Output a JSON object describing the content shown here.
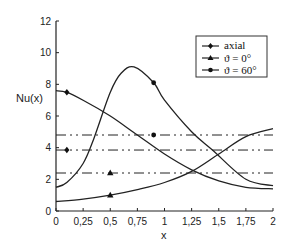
{
  "chart_data": {
    "type": "line",
    "title": "",
    "xlabel": "x",
    "ylabel": "Nu(x)",
    "xlim": [
      0,
      2
    ],
    "ylim": [
      0,
      12
    ],
    "grid": false,
    "legend_position": "upper right (inside)",
    "x_ticks": [
      "0",
      "0,25",
      "0,5",
      "0,75",
      "1",
      "1,25",
      "1,5",
      "1,75",
      "2"
    ],
    "y_ticks": [
      "0",
      "2",
      "4",
      "6",
      "8",
      "10",
      "12"
    ],
    "series": [
      {
        "name": "axial",
        "marker": "diamond",
        "x": [
          0,
          0.1,
          0.25,
          0.5,
          0.75,
          1.0,
          1.25,
          1.5,
          1.75,
          2.0
        ],
        "values": [
          7.6,
          7.5,
          7.0,
          6.0,
          4.8,
          3.6,
          2.6,
          1.9,
          1.5,
          1.4
        ],
        "average": 3.85,
        "average_marker_x": 0.1
      },
      {
        "name": "ϑ = 0°",
        "marker": "triangle",
        "x": [
          0,
          0.25,
          0.5,
          0.75,
          1.0,
          1.25,
          1.5,
          1.75,
          2.0
        ],
        "values": [
          0.6,
          0.75,
          1.0,
          1.35,
          1.8,
          2.5,
          3.6,
          4.7,
          5.2
        ],
        "average": 2.4,
        "average_marker_x": 0.5
      },
      {
        "name": "ϑ = 60°",
        "marker": "circle",
        "x": [
          0,
          0.1,
          0.25,
          0.35,
          0.5,
          0.6,
          0.72,
          0.9,
          1.0,
          1.25,
          1.45,
          1.75,
          2.0
        ],
        "values": [
          1.5,
          1.8,
          3.0,
          4.6,
          7.5,
          8.7,
          9.1,
          8.1,
          7.0,
          5.0,
          3.8,
          2.0,
          1.6
        ],
        "average": 4.8,
        "average_marker_x": 0.9
      }
    ]
  },
  "legend": {
    "items": [
      "axial",
      "ϑ = 0°",
      "ϑ = 60°"
    ]
  },
  "axes": {
    "xlabel": "x",
    "ylabel": "Nu(x)"
  }
}
